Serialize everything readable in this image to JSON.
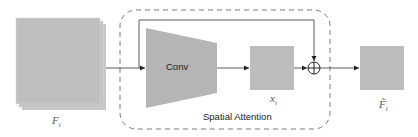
{
  "diagram": {
    "colors": {
      "block_fill": "#bdbdbd",
      "block_fill_dark": "#b3b3b3",
      "line": "#333333",
      "dashed_border": "#7a7a7a"
    },
    "nodes": {
      "input_feature": {
        "label_main": "F",
        "label_sub": "i"
      },
      "conv": {
        "label": "Conv"
      },
      "attention_map": {
        "label_main": "x",
        "label_sub": "i"
      },
      "add_op": {
        "symbol": "⊕"
      },
      "output_feature": {
        "label_main": "F̃",
        "label_sub": "i"
      }
    },
    "group": {
      "label": "Spatial Attention"
    },
    "edges": [
      {
        "from": "input_feature",
        "to": "conv"
      },
      {
        "from": "conv",
        "to": "attention_map"
      },
      {
        "from": "attention_map",
        "to": "add_op"
      },
      {
        "from": "input_feature",
        "to": "add_op",
        "type": "skip"
      },
      {
        "from": "add_op",
        "to": "output_feature"
      }
    ]
  }
}
